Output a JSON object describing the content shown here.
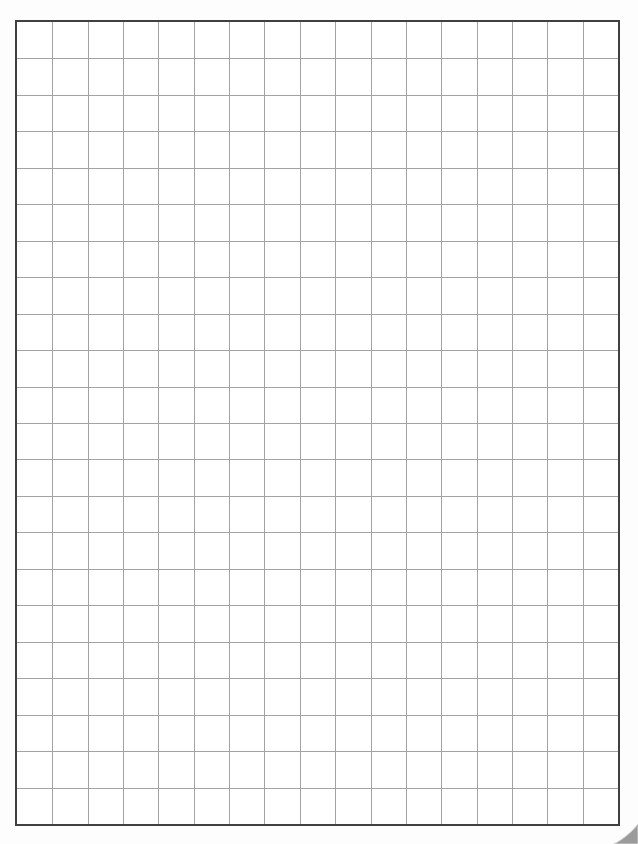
{
  "page": {
    "kind": "blank-graph-paper-scan",
    "background_color": "#fdfdfd",
    "sheet": {
      "left": 15,
      "top": 20,
      "width": 605,
      "height": 806,
      "fill_color": "#ffffff",
      "border_color": "#404040",
      "border_width": 2
    },
    "grid": {
      "columns": 17,
      "rows": 22,
      "line_color": "#a3a3a3",
      "line_width": 1
    },
    "corner_curl": {
      "width": 26,
      "height": 22,
      "fill_color": "#9b9b9b",
      "edge_color": "#d2d2d2"
    }
  }
}
